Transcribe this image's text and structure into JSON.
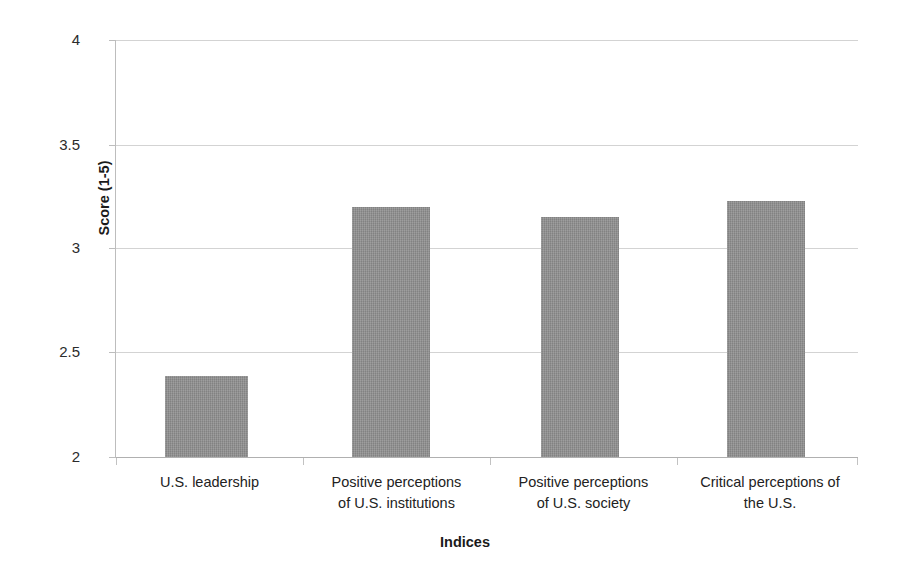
{
  "chart_data": {
    "type": "bar",
    "title": "",
    "subtitle": "",
    "xlabel": "Indices",
    "ylabel": "Score (1-5)",
    "categories": [
      "U.S. leadership",
      "Positive perceptions of U.S. institutions",
      "Positive perceptions of U.S. society",
      "Critical perceptions of the U.S."
    ],
    "category_lines": [
      [
        "U.S. leadership"
      ],
      [
        "Positive perceptions",
        "of U.S. institutions"
      ],
      [
        "Positive perceptions",
        "of U.S. society"
      ],
      [
        "Critical perceptions of",
        "the U.S."
      ]
    ],
    "values": [
      2.39,
      3.2,
      3.15,
      3.23
    ],
    "ylim": [
      2,
      4
    ],
    "yticks": [
      2,
      2.5,
      3,
      3.5,
      4
    ],
    "ytick_labels": [
      "2",
      "2.5",
      "3",
      "3.5",
      "4"
    ],
    "grid": true,
    "grid_axis": "y",
    "legend": false,
    "legend_position": "none",
    "series": [
      {
        "name": "Score",
        "color": "#8b8b8b",
        "values": [
          2.39,
          3.2,
          3.15,
          3.23
        ]
      }
    ]
  },
  "axes": {
    "y_title": "Score (1-5)",
    "x_title": "Indices",
    "y_labels": [
      "4",
      "3.5",
      "3",
      "2.5",
      "2"
    ]
  },
  "colors": {
    "bar_fill": "#8b8b8b",
    "gridline": "#d3d3d3",
    "axis": "#b0b0b0",
    "text": "#222222",
    "background": "#ffffff"
  }
}
